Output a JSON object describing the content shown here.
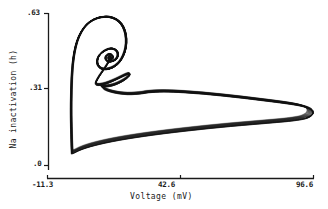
{
  "chart_data": {
    "type": "line",
    "title": "",
    "subtitle": "",
    "xlabel": "Voltage (mV)",
    "ylabel": "Na inactivation (h)",
    "xlim": [
      -11.3,
      96.6
    ],
    "ylim": [
      0.0,
      0.63
    ],
    "xticks": [
      -11.3,
      42.6,
      96.6
    ],
    "xtick_labels": [
      "-11.3",
      "42.6",
      "96.6"
    ],
    "yticks": [
      0.0,
      0.31,
      0.63
    ],
    "ytick_labels": [
      ".0",
      ".31",
      ".63"
    ],
    "grid": false,
    "legend": null,
    "legend_position": "none",
    "series": [
      {
        "name": "phase-plane trajectory",
        "description": "Chaotic attractor orbit of a Hodgkin-Huxley type neuron model in the voltage / Na-inactivation phase plane: a tight nested spiral near the upper-left depolarized subthreshold region, a sharp rise on the left branch, and a long thin elongated excursion to the far right that folds back along a low-h return path.",
        "points": [
          [
            -1.5,
            0.05
          ],
          [
            -1.6,
            0.075
          ],
          [
            -1.7,
            0.11
          ],
          [
            -1.8,
            0.15
          ],
          [
            -1.9,
            0.2
          ],
          [
            -1.9,
            0.255
          ],
          [
            -1.8,
            0.31
          ],
          [
            -1.6,
            0.365
          ],
          [
            -1.2,
            0.42
          ],
          [
            -0.5,
            0.47
          ],
          [
            0.6,
            0.515
          ],
          [
            2.2,
            0.552
          ],
          [
            4.4,
            0.583
          ],
          [
            7.2,
            0.604
          ],
          [
            10.4,
            0.615
          ],
          [
            13.6,
            0.616
          ],
          [
            16.4,
            0.606
          ],
          [
            18.6,
            0.586
          ],
          [
            20.0,
            0.558
          ],
          [
            20.6,
            0.524
          ],
          [
            20.4,
            0.488
          ],
          [
            19.4,
            0.455
          ],
          [
            17.8,
            0.428
          ],
          [
            15.8,
            0.41
          ],
          [
            13.6,
            0.4
          ],
          [
            11.6,
            0.398
          ],
          [
            10.0,
            0.404
          ],
          [
            9.0,
            0.417
          ],
          [
            8.8,
            0.434
          ],
          [
            9.4,
            0.452
          ],
          [
            10.8,
            0.468
          ],
          [
            12.6,
            0.479
          ],
          [
            14.4,
            0.484
          ],
          [
            16.0,
            0.48
          ],
          [
            17.0,
            0.469
          ],
          [
            17.2,
            0.455
          ],
          [
            16.6,
            0.442
          ],
          [
            15.4,
            0.433
          ],
          [
            14.0,
            0.43
          ],
          [
            12.8,
            0.433
          ],
          [
            12.2,
            0.442
          ],
          [
            12.4,
            0.452
          ],
          [
            13.2,
            0.459
          ],
          [
            14.2,
            0.46
          ],
          [
            15.0,
            0.455
          ],
          [
            15.2,
            0.447
          ],
          [
            14.8,
            0.441
          ],
          [
            14.0,
            0.439
          ],
          [
            13.4,
            0.442
          ],
          [
            13.4,
            0.448
          ],
          [
            13.9,
            0.451
          ],
          [
            14.4,
            0.449
          ],
          [
            14.5,
            0.445
          ],
          [
            14.1,
            0.443
          ],
          [
            13.0,
            0.42
          ],
          [
            11.2,
            0.392
          ],
          [
            9.6,
            0.368
          ],
          [
            8.6,
            0.35
          ],
          [
            8.2,
            0.34
          ],
          [
            8.6,
            0.334
          ],
          [
            10.0,
            0.333
          ],
          [
            12.2,
            0.338
          ],
          [
            14.8,
            0.348
          ],
          [
            17.4,
            0.36
          ],
          [
            19.6,
            0.371
          ],
          [
            21.2,
            0.378
          ],
          [
            22.0,
            0.379
          ],
          [
            22.0,
            0.374
          ],
          [
            21.2,
            0.364
          ],
          [
            19.6,
            0.352
          ],
          [
            17.4,
            0.34
          ],
          [
            15.0,
            0.331
          ],
          [
            12.8,
            0.327
          ],
          [
            11.2,
            0.327
          ],
          [
            10.4,
            0.332
          ],
          [
            11.8,
            0.316
          ],
          [
            14.6,
            0.305
          ],
          [
            18.0,
            0.298
          ],
          [
            21.4,
            0.295
          ],
          [
            24.6,
            0.296
          ],
          [
            27.4,
            0.299
          ],
          [
            30.0,
            0.303
          ],
          [
            36.0,
            0.306
          ],
          [
            44.0,
            0.303
          ],
          [
            52.0,
            0.297
          ],
          [
            60.0,
            0.289
          ],
          [
            68.0,
            0.28
          ],
          [
            76.0,
            0.27
          ],
          [
            83.0,
            0.261
          ],
          [
            88.5,
            0.253
          ],
          [
            92.5,
            0.245
          ],
          [
            95.0,
            0.236
          ],
          [
            96.2,
            0.226
          ],
          [
            96.4,
            0.215
          ],
          [
            95.6,
            0.205
          ],
          [
            93.8,
            0.196
          ],
          [
            91.0,
            0.19
          ],
          [
            86.5,
            0.184
          ],
          [
            80.0,
            0.178
          ],
          [
            72.0,
            0.171
          ],
          [
            63.0,
            0.163
          ],
          [
            54.0,
            0.154
          ],
          [
            45.0,
            0.144
          ],
          [
            36.0,
            0.133
          ],
          [
            28.0,
            0.122
          ],
          [
            21.0,
            0.111
          ],
          [
            15.0,
            0.1
          ],
          [
            10.0,
            0.089
          ],
          [
            6.2,
            0.079
          ],
          [
            3.4,
            0.07
          ],
          [
            1.4,
            0.062
          ],
          [
            0.2,
            0.056
          ],
          [
            -0.6,
            0.052
          ],
          [
            -1.1,
            0.05
          ],
          [
            -1.4,
            0.05
          ]
        ]
      }
    ],
    "annotations": []
  },
  "axes": {
    "x": {
      "title": "Voltage (mV)",
      "tick_labels": {
        "left": "-11.3",
        "middle": "42.6",
        "right": "96.6"
      }
    },
    "y": {
      "title": "Na inactivation (h)",
      "tick_labels": {
        "top": ".63",
        "middle": ".31",
        "bottom": ".0"
      }
    }
  },
  "colors": {
    "background": "#ffffff",
    "axis": "#1a1a1a",
    "trace": "#111111",
    "text": "#1a1a1a"
  }
}
